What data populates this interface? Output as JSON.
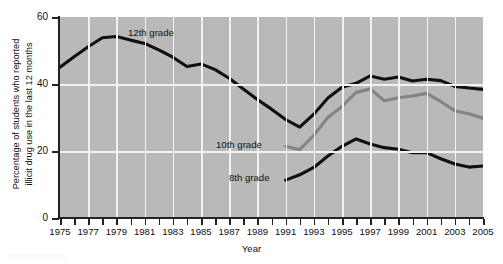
{
  "chart_data": {
    "type": "line",
    "title": "",
    "xlabel": "Year",
    "ylabel_line1": "Percentage of students who reported",
    "ylabel_line2": "illicit drug use in the last 12 months",
    "xlim": [
      1975,
      2005
    ],
    "ylim": [
      0,
      60
    ],
    "yticks": [
      0,
      20,
      40,
      60
    ],
    "ytick_labels": [
      "0",
      "20",
      "40",
      "60"
    ],
    "xticks": [
      1975,
      1976,
      1977,
      1978,
      1979,
      1980,
      1981,
      1982,
      1983,
      1984,
      1985,
      1986,
      1987,
      1988,
      1989,
      1990,
      1991,
      1992,
      1993,
      1994,
      1995,
      1996,
      1997,
      1998,
      1999,
      2000,
      2001,
      2002,
      2003,
      2004,
      2005
    ],
    "xtick_labels": [
      "1975",
      "1977",
      "1979",
      "1981",
      "1983",
      "1985",
      "1987",
      "1989",
      "1991",
      "1993",
      "1995",
      "1997",
      "1999",
      "2001",
      "2003",
      "2005"
    ],
    "xtick_label_years": [
      1975,
      1977,
      1979,
      1981,
      1983,
      1985,
      1987,
      1989,
      1991,
      1993,
      1995,
      1997,
      1999,
      2001,
      2003,
      2005
    ],
    "grid": "white gridlines on gray panel",
    "legend": "inline series annotations",
    "plot_background": "#b9b9b9",
    "gridline_color": "#f2f2f2",
    "series": [
      {
        "name": "12th grade",
        "color": "#101010",
        "label_x": 1982,
        "label_y": 56,
        "x": [
          1975,
          1976,
          1977,
          1978,
          1979,
          1980,
          1981,
          1982,
          1983,
          1984,
          1985,
          1986,
          1987,
          1988,
          1989,
          1990,
          1991,
          1992,
          1993,
          1994,
          1995,
          1996,
          1997,
          1998,
          1999,
          2000,
          2001,
          2002,
          2003,
          2004,
          2005
        ],
        "values": [
          45.0,
          48.1,
          51.1,
          53.8,
          54.2,
          53.1,
          52.1,
          50.2,
          48.0,
          45.2,
          46.0,
          44.3,
          41.7,
          38.5,
          35.4,
          32.5,
          29.4,
          27.1,
          31.0,
          35.8,
          39.0,
          40.2,
          42.4,
          41.4,
          42.1,
          40.9,
          41.4,
          41.0,
          39.3,
          38.8,
          38.4
        ]
      },
      {
        "name": "10th grade",
        "color": "#848484",
        "label_x": 1988,
        "label_y": 22,
        "x": [
          1991,
          1992,
          1993,
          1994,
          1995,
          1996,
          1997,
          1998,
          1999,
          2000,
          2001,
          2002,
          2003,
          2004,
          2005
        ],
        "values": [
          21.4,
          20.4,
          24.7,
          30.0,
          33.3,
          37.5,
          38.5,
          35.0,
          35.9,
          36.4,
          37.2,
          34.8,
          32.0,
          31.1,
          29.8
        ]
      },
      {
        "name": "8th grade",
        "color": "#101010",
        "label_x": 1989,
        "label_y": 12,
        "x": [
          1991,
          1992,
          1993,
          1994,
          1995,
          1996,
          1997,
          1998,
          1999,
          2000,
          2001,
          2002,
          2003,
          2004,
          2005
        ],
        "values": [
          11.3,
          12.9,
          15.1,
          18.5,
          21.4,
          23.6,
          22.1,
          21.0,
          20.5,
          19.5,
          19.5,
          17.7,
          16.1,
          15.2,
          15.5
        ]
      }
    ]
  }
}
